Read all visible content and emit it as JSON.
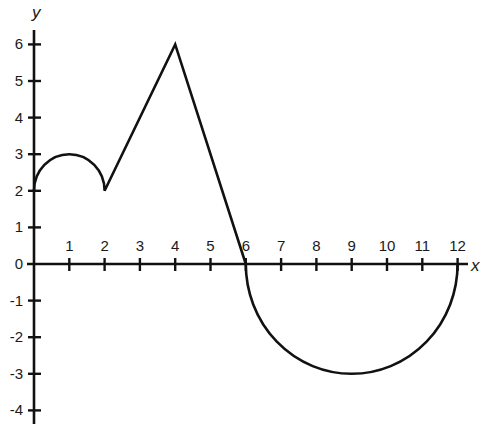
{
  "chart_data": {
    "type": "line",
    "title": "",
    "xlabel": "x",
    "ylabel": "y",
    "xlim": [
      0,
      12
    ],
    "ylim": [
      -4,
      6
    ],
    "grid": false,
    "legend": null,
    "x_ticks": [
      1,
      2,
      3,
      4,
      5,
      6,
      7,
      8,
      9,
      10,
      11,
      12
    ],
    "y_ticks": [
      -4,
      -3,
      -2,
      -1,
      0,
      1,
      2,
      3,
      4,
      5,
      6
    ],
    "segments": [
      {
        "kind": "semicircle_upper",
        "description": "upper semicircle arc centered at (1,2), radius 1, from (0,2) to (2,2)",
        "center": [
          1,
          2
        ],
        "radius": 1,
        "x_range": [
          0,
          2
        ]
      },
      {
        "kind": "line",
        "points": [
          [
            2,
            2
          ],
          [
            4,
            6
          ]
        ]
      },
      {
        "kind": "line",
        "points": [
          [
            4,
            6
          ],
          [
            6,
            0
          ]
        ]
      },
      {
        "kind": "semicircle_lower",
        "description": "lower semicircle centered at (9,0), radius 3, from (6,0) to (12,0)",
        "center": [
          9,
          0
        ],
        "radius": 3,
        "x_range": [
          6,
          12
        ]
      }
    ],
    "key_points": [
      [
        0,
        2
      ],
      [
        1,
        3
      ],
      [
        2,
        2
      ],
      [
        4,
        6
      ],
      [
        6,
        0
      ],
      [
        9,
        -3
      ],
      [
        12,
        0
      ]
    ]
  },
  "labels": {
    "x_axis": "x",
    "y_axis": "y",
    "origin": "0"
  },
  "style": {
    "line_color": "#111111",
    "background": "#ffffff"
  }
}
